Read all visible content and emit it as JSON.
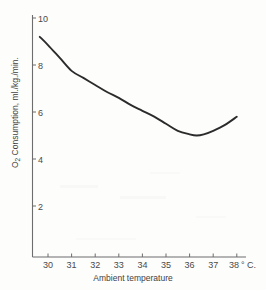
{
  "figure": {
    "title": "",
    "background_color": "#fdfdfc",
    "curve_color": "#2b2b2b",
    "axis_color": "#6d6d6d"
  },
  "axes": {
    "x": {
      "label": "Ambient temperature",
      "unit_suffix": "° C.",
      "ticks": [
        "30",
        "31",
        "32",
        "33",
        "34",
        "35",
        "36",
        "37",
        "38"
      ],
      "tick_values": [
        30,
        31,
        32,
        33,
        34,
        35,
        36,
        37,
        38
      ],
      "range": [
        29.3,
        38.4
      ]
    },
    "y": {
      "label_main": "O",
      "label_sub": "2",
      "label_rest": " Consumption, ml./kg./min.",
      "label_full": "O2 Consumption, ml./kg./min.",
      "ticks": [
        "10",
        "8",
        "6",
        "4",
        "2"
      ],
      "tick_values": [
        10,
        8,
        6,
        4,
        2
      ],
      "range": [
        0,
        10.2
      ]
    }
  },
  "chart_data": {
    "type": "line",
    "title": "",
    "xlabel": "Ambient temperature",
    "ylabel": "O2 Consumption, mL./kg./min.",
    "xlim": [
      29.3,
      38.4
    ],
    "ylim": [
      0,
      10.2
    ],
    "xticks": [
      30,
      31,
      32,
      33,
      34,
      35,
      36,
      37,
      38
    ],
    "yticks": [
      2,
      4,
      6,
      8,
      10
    ],
    "grid": false,
    "legend": false,
    "x_unit": "° C.",
    "y_unit": "mL./kg./min.",
    "series": [
      {
        "name": "O2 consumption",
        "color": "#2b2b2b",
        "x": [
          29.65,
          30.0,
          30.5,
          31.0,
          31.5,
          32.0,
          32.5,
          33.0,
          33.5,
          34.0,
          34.5,
          35.0,
          35.5,
          36.0,
          36.3,
          36.6,
          37.0,
          37.5,
          38.0
        ],
        "y": [
          9.2,
          8.85,
          8.3,
          7.75,
          7.45,
          7.15,
          6.85,
          6.6,
          6.3,
          6.05,
          5.8,
          5.5,
          5.2,
          5.05,
          5.0,
          5.05,
          5.2,
          5.45,
          5.8
        ]
      }
    ]
  }
}
